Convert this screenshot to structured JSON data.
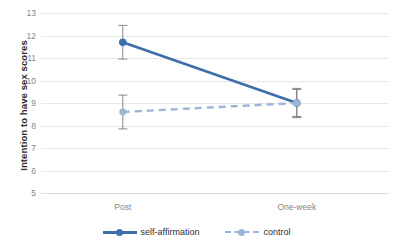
{
  "chart_data": {
    "type": "line",
    "title": "",
    "xlabel": "",
    "ylabel": "Intention to have sex scores",
    "categories": [
      "Post",
      "One-week"
    ],
    "ylim": [
      5,
      13
    ],
    "yticks": [
      5,
      6,
      7,
      8,
      9,
      10,
      11,
      12,
      13
    ],
    "grid": true,
    "legend_position": "bottom",
    "series": [
      {
        "name": "self-affirmation",
        "values": [
          11.7,
          9.0
        ],
        "errors": [
          0.75,
          0.6
        ],
        "color": "#3f6fa8",
        "linestyle": "solid"
      },
      {
        "name": "control",
        "values": [
          8.6,
          9.0
        ],
        "errors": [
          0.75,
          0.65
        ],
        "color": "#9cb5d8",
        "linestyle": "dashed"
      }
    ]
  },
  "axis": {
    "y_title": "Intention to have sex scores",
    "y_tick_labels": [
      "13",
      "12",
      "11",
      "10",
      "9",
      "8",
      "7",
      "6",
      "5"
    ],
    "x_tick_labels": [
      "Post",
      "One-week"
    ]
  },
  "legend": {
    "entries": [
      {
        "label": "self-affirmation",
        "style": "solid"
      },
      {
        "label": "control",
        "style": "dashed"
      }
    ]
  },
  "colors": {
    "series_primary": "#3f6fa8",
    "series_secondary": "#9cb5d8",
    "gridline": "#e8e8ea",
    "errorbar": "#7a7a7a",
    "tick_text": "#868686",
    "title_text": "#2b2b2b"
  }
}
